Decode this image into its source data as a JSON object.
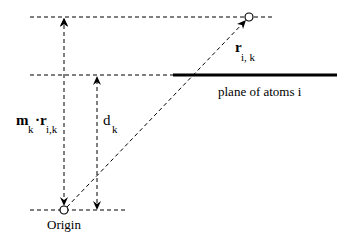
{
  "diagram": {
    "type": "geometry-schematic",
    "labels": {
      "projection": {
        "main": "m",
        "main_sub": "k",
        "dot": "·",
        "vec": "r",
        "vec_sub": "i,k"
      },
      "distance": {
        "main": "d",
        "sub": "k"
      },
      "vector": {
        "main": "r",
        "sub": "i, k"
      },
      "plane": "plane of atoms i",
      "origin": "Origin"
    },
    "colors": {
      "stroke": "#000000",
      "background": "#ffffff"
    },
    "elements": {
      "top_reference_line": "dashed horizontal through atom position",
      "plane_reference_line": "dashed horizontal extending plane",
      "plane_line": "thick solid line representing plane of atoms i",
      "bottom_reference_line": "dashed horizontal through origin",
      "projection_arrow": "dashed vertical double-headed arrow from origin level to atom level",
      "distance_arrow": "dashed vertical double-headed arrow from origin level to plane level",
      "position_vector": "dashed diagonal arrow from origin to atom"
    }
  }
}
